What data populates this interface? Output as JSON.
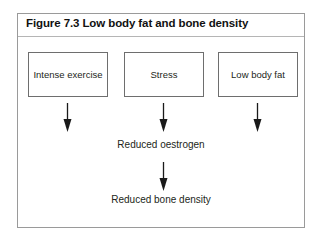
{
  "figure": {
    "title": "Figure 7.3 Low body fat and bone density",
    "border_color": "#9a9a9a",
    "text_color": "#231f20",
    "background": "#ffffff"
  },
  "diagram": {
    "causes": [
      {
        "label": "Intense exercise",
        "arrow_icon": "arrow-down-icon"
      },
      {
        "label": "Stress",
        "arrow_icon": "arrow-down-icon"
      },
      {
        "label": "Low body fat",
        "arrow_icon": "arrow-down-icon"
      }
    ],
    "intermediate": {
      "label": "Reduced oestrogen",
      "arrow_icon": "arrow-down-icon"
    },
    "outcome": {
      "label": "Reduced bone density"
    }
  }
}
